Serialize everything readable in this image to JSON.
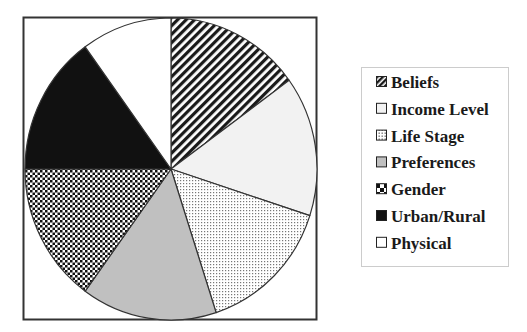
{
  "chart_data": {
    "type": "pie",
    "title": "",
    "start_angle_deg": 0,
    "direction": "clockwise",
    "categories": [
      "Beliefs",
      "Income Level",
      "Life Stage",
      "Preferences",
      "Gender",
      "Urban/Rural",
      "Physical"
    ],
    "values": [
      15,
      15,
      15,
      15,
      15,
      15,
      10
    ],
    "units": "percent (estimated from slice angles)",
    "slices": [
      {
        "label": "Beliefs",
        "value": 15,
        "fill": "diagonal-stripes",
        "color": "#1a1a1a"
      },
      {
        "label": "Income Level",
        "value": 15,
        "fill": "solid",
        "color": "#f2f2f2"
      },
      {
        "label": "Life Stage",
        "value": 15,
        "fill": "dots",
        "color": "#888888"
      },
      {
        "label": "Preferences",
        "value": 15,
        "fill": "solid",
        "color": "#c0c0c0"
      },
      {
        "label": "Gender",
        "value": 15,
        "fill": "checkerboard",
        "color": "#111111"
      },
      {
        "label": "Urban/Rural",
        "value": 15,
        "fill": "solid",
        "color": "#111111"
      },
      {
        "label": "Physical",
        "value": 10,
        "fill": "solid",
        "color": "#ffffff"
      }
    ],
    "legend": {
      "position": "right",
      "entries": [
        "Beliefs",
        "Income Level",
        "Life Stage",
        "Preferences",
        "Gender",
        "Urban/Rural",
        "Physical"
      ]
    }
  }
}
